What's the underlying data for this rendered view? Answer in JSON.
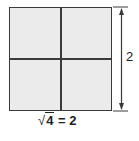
{
  "diagram": {
    "type": "area-model-square",
    "grid": {
      "rows": 2,
      "cols": 2
    },
    "fill_color": "#ebebeb",
    "line_color": "#3a3a3a",
    "dimension_label": "2",
    "formula": {
      "radical_symbol": "√",
      "radicand": "4",
      "equals": " = ",
      "result": "2"
    }
  }
}
